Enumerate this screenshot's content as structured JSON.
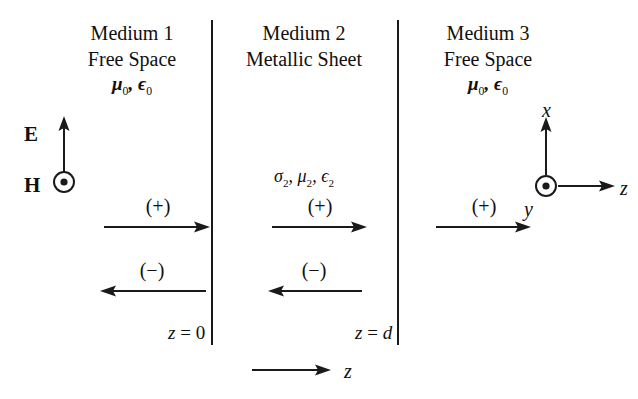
{
  "figure": {
    "background_color": "#ffffff",
    "ink_color": "#1a1a1a"
  },
  "media": [
    {
      "id": "medium-1",
      "title": "Medium 1",
      "subtitle": "Free Space",
      "parameters": "μ0, ϵ0",
      "parameter_mu": "μ",
      "parameter_mu_sub": "0",
      "parameter_eps": "ϵ",
      "parameter_eps_sub": "0",
      "waves": [
        {
          "label": "(+)",
          "direction": "right"
        },
        {
          "label": "(−)",
          "direction": "left"
        }
      ]
    },
    {
      "id": "medium-2",
      "title": "Medium 2",
      "subtitle": "Metallic Sheet",
      "parameters": "σ2, μ2, ϵ2",
      "sigma": "σ",
      "sigma_sub": "2",
      "mu": "μ",
      "mu_sub": "2",
      "eps": "ϵ",
      "eps_sub": "2",
      "waves": [
        {
          "label": "(+)",
          "direction": "right"
        },
        {
          "label": "(−)",
          "direction": "left"
        }
      ]
    },
    {
      "id": "medium-3",
      "title": "Medium 3",
      "subtitle": "Free Space",
      "parameters": "μ0, ϵ0",
      "parameter_mu": "μ",
      "parameter_mu_sub": "0",
      "parameter_eps": "ϵ",
      "parameter_eps_sub": "0",
      "waves": [
        {
          "label": "(+)",
          "direction": "right"
        }
      ]
    }
  ],
  "boundaries": [
    {
      "id": "boundary-left",
      "label_var": "z",
      "label_eq": "=",
      "label_value": "0"
    },
    {
      "id": "boundary-right",
      "label_var": "z",
      "label_eq": "=",
      "label_value": "d"
    }
  ],
  "fields": {
    "electric": {
      "label": "E",
      "direction": "up",
      "symbol": "arrow-up"
    },
    "magnetic": {
      "label": "H",
      "direction": "out-of-page",
      "symbol": "circle-dot"
    }
  },
  "axes": {
    "x": {
      "label": "x",
      "direction": "up"
    },
    "y": {
      "label": "y",
      "direction": "out-of-page",
      "symbol": "circle-dot"
    },
    "z": {
      "label": "z",
      "direction": "right"
    }
  },
  "propagation_axis": {
    "label": "z",
    "direction": "right"
  }
}
